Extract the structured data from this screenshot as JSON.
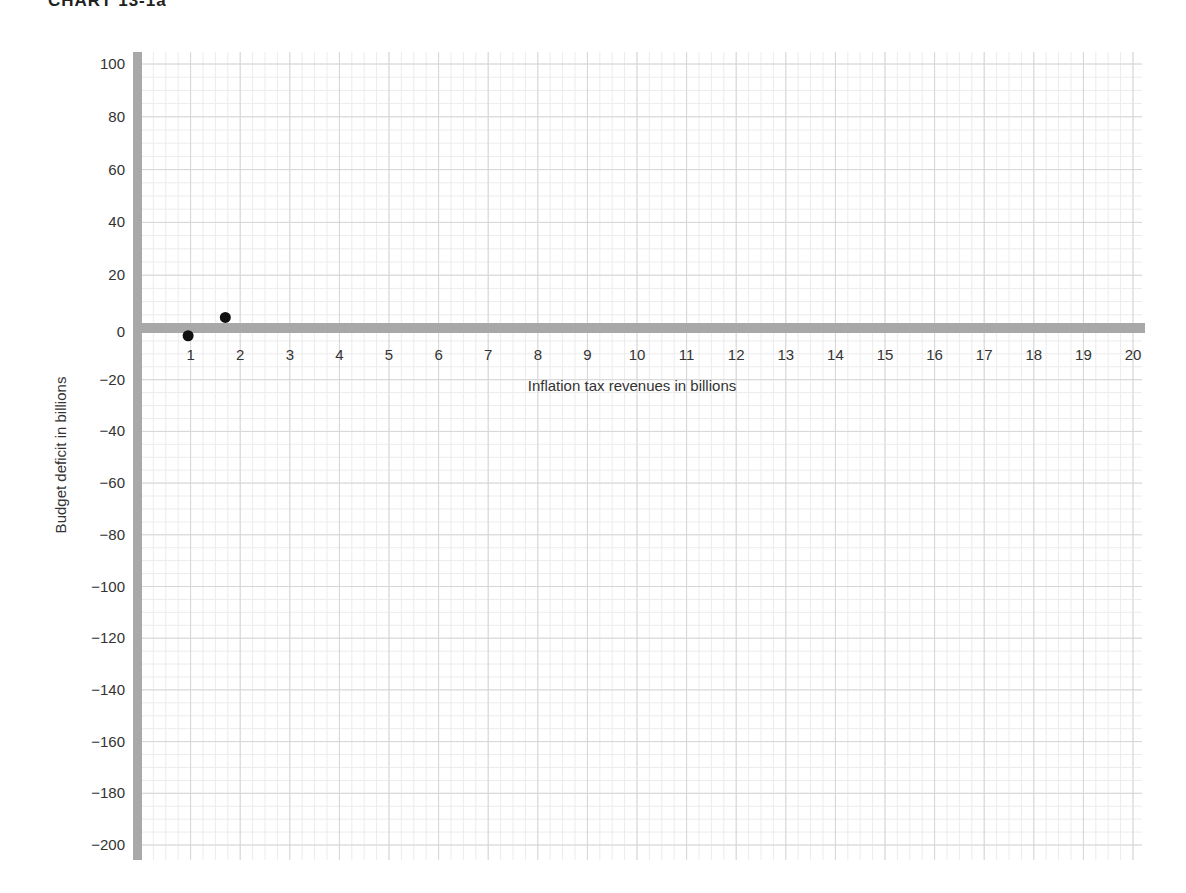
{
  "title": "CHART 13-1a",
  "chart_data": {
    "type": "scatter",
    "title": "CHART 13-1a",
    "xlabel": "Inflation tax revenues in billions",
    "ylabel": "Budget deficit in billions",
    "xlim": [
      0,
      20
    ],
    "ylim": [
      -200,
      100
    ],
    "x_ticks": [
      1,
      2,
      3,
      4,
      5,
      6,
      7,
      8,
      9,
      10,
      11,
      12,
      13,
      14,
      15,
      16,
      17,
      18,
      19,
      20
    ],
    "y_ticks": [
      100,
      80,
      60,
      40,
      20,
      0,
      -20,
      -40,
      -60,
      -80,
      -100,
      -120,
      -140,
      -160,
      -180,
      -200
    ],
    "grid": true,
    "legend": null,
    "series": [
      {
        "name": "Data points",
        "points": [
          {
            "x": 0.95,
            "y": -3
          },
          {
            "x": 1.7,
            "y": 4
          }
        ]
      }
    ]
  },
  "style": {
    "axis_color": "#a8a8a8",
    "grid_color": "#d6d6d6",
    "grid_minor_color": "#ececec",
    "point_color": "#111111"
  }
}
